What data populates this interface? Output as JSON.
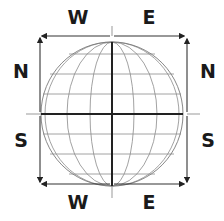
{
  "diagram": {
    "labels": {
      "top_left": "W",
      "top_right": "E",
      "left_upper": "N",
      "right_upper": "N",
      "left_lower": "S",
      "right_lower": "S",
      "bottom_left": "W",
      "bottom_right": "E"
    },
    "globe": {
      "center": [
        112,
        114
      ],
      "radius_x": 71,
      "radius_y": 72,
      "latitude_lines_y": [
        54,
        74,
        94,
        134,
        154,
        174
      ],
      "equator_y": 114,
      "meridian_half_widths": [
        67,
        45,
        22
      ],
      "central_meridian_x": 112
    },
    "frame": {
      "left": 40,
      "right": 187,
      "top": 36,
      "bottom": 184
    },
    "colors": {
      "line_thin": "#8a8a8a",
      "line_thick": "#222222",
      "arrow": "#333333",
      "text": "#1a1a1a"
    }
  }
}
